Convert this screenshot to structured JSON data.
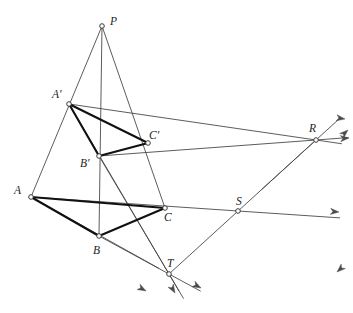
{
  "figure": {
    "kind": "geometry-diagram",
    "width": 353,
    "height": 313,
    "background_color": "#ffffff",
    "line_color": "#4a4a4a",
    "bold_line_color": "#111111",
    "label_color": "#1d1d1d",
    "marker_fill": "#ffffff",
    "marker_stroke": "#3a3a3a"
  },
  "points": [
    {
      "id": "P",
      "label": "P",
      "x": 102,
      "y": 26,
      "label_x": 110,
      "label_y": 16,
      "role": "perspective-center"
    },
    {
      "id": "Ap",
      "label": "A′",
      "x": 69,
      "y": 104,
      "label_x": 52,
      "label_y": 89,
      "role": "triangle2-vertex"
    },
    {
      "id": "Bp",
      "label": "B′",
      "x": 99,
      "y": 156,
      "label_x": 80,
      "label_y": 158,
      "role": "triangle2-vertex"
    },
    {
      "id": "Cp",
      "label": "C′",
      "x": 148,
      "y": 143,
      "label_x": 149,
      "label_y": 130,
      "role": "triangle2-vertex"
    },
    {
      "id": "A",
      "label": "A",
      "x": 31,
      "y": 197,
      "label_x": 14,
      "label_y": 185,
      "role": "triangle1-vertex"
    },
    {
      "id": "B",
      "label": "B",
      "x": 99,
      "y": 236,
      "label_x": 93,
      "label_y": 245,
      "role": "triangle1-vertex"
    },
    {
      "id": "C",
      "label": "C",
      "x": 165,
      "y": 208,
      "label_x": 164,
      "label_y": 212,
      "role": "triangle1-vertex"
    },
    {
      "id": "R",
      "label": "R",
      "x": 316,
      "y": 140,
      "label_x": 309,
      "label_y": 123,
      "role": "axis-point"
    },
    {
      "id": "S",
      "label": "S",
      "x": 238,
      "y": 211,
      "label_x": 236,
      "label_y": 196,
      "role": "axis-point"
    },
    {
      "id": "T",
      "label": "T",
      "x": 169,
      "y": 274,
      "label_x": 167,
      "label_y": 258,
      "role": "axis-point"
    }
  ],
  "bold_segments": [
    {
      "name": "segment-A-B",
      "from": "A",
      "to": "B"
    },
    {
      "name": "segment-B-C",
      "from": "B",
      "to": "C"
    },
    {
      "name": "segment-A-C",
      "from": "A",
      "to": "C"
    },
    {
      "name": "segment-Ap-Bp",
      "from": "Ap",
      "to": "Bp"
    },
    {
      "name": "segment-Bp-Cp",
      "from": "Bp",
      "to": "Cp"
    },
    {
      "name": "segment-Ap-Cp",
      "from": "Ap",
      "to": "Cp"
    }
  ],
  "thin_segments": [
    {
      "name": "ray-P-through-Ap-to-A",
      "from": "P",
      "to": "A"
    },
    {
      "name": "ray-P-through-Bp-to-B",
      "from": "P",
      "to": "B"
    },
    {
      "name": "ray-P-through-Cp-to-C",
      "from": "P",
      "to": "C"
    }
  ],
  "extended_lines": [
    {
      "name": "line-Ap-Cp-to-R",
      "from": "Ap",
      "to": "R",
      "arrow_x": 345,
      "arrow_y": 119
    },
    {
      "name": "line-A-C-to-S",
      "from": "A",
      "to": "S",
      "arrow_x": 340,
      "arrow_y": 212
    },
    {
      "name": "line-Bp-Cp-to-T",
      "from": "Bp",
      "to": "T",
      "arrow_x": 199,
      "arrow_y": 289
    },
    {
      "name": "line-B-C-to-T",
      "from": "B",
      "to": "T",
      "arrow_x": 202,
      "arrow_y": 288
    },
    {
      "name": "line-Ap-Bp-to-T",
      "from": "Ap",
      "to": "T",
      "arrow_x": 175,
      "arrow_y": 293
    },
    {
      "name": "line-A-B-to-T",
      "from": "A",
      "to": "T",
      "arrow_x": 146,
      "arrow_y": 291
    },
    {
      "name": "line-T-S-R",
      "from": "T",
      "to": "R",
      "arrow_x": 348,
      "arrow_y": 131
    },
    {
      "name": "line-R-through-S-down",
      "from": "R",
      "to": "S",
      "arrow_x": 337,
      "arrow_y": 272
    },
    {
      "name": "line-Bp-C-to-R",
      "from": "Bp",
      "to": "R",
      "arrow_x": 348,
      "arrow_y": 137
    }
  ],
  "arrowheads": [
    {
      "name": "arrowhead-upper-right-1",
      "x": 345,
      "y": 119
    },
    {
      "name": "arrowhead-upper-right-2",
      "x": 348,
      "y": 130
    },
    {
      "name": "arrowhead-upper-right-3",
      "x": 349,
      "y": 138
    },
    {
      "name": "arrowhead-right-middle",
      "x": 339,
      "y": 212
    },
    {
      "name": "arrowhead-lower-right",
      "x": 337,
      "y": 272
    },
    {
      "name": "arrowhead-bottom-left",
      "x": 146,
      "y": 291
    },
    {
      "name": "arrowhead-bottom-middle",
      "x": 175,
      "y": 293
    },
    {
      "name": "arrowhead-bottom-right",
      "x": 201,
      "y": 288
    }
  ]
}
